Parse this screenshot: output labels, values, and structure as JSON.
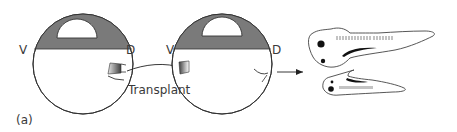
{
  "figure": {
    "panel_label": "(a)",
    "embryo_1": {
      "ventral_label": "V",
      "dorsal_label": "D"
    },
    "embryo_2": {
      "ventral_label": "V",
      "dorsal_label": "D"
    },
    "transplant_label": "Transplant",
    "colors": {
      "animal_cap": "#7a7a7a",
      "outline": "#333333",
      "graft_dark": "#4a4a4a",
      "graft_light": "#e0e0e0",
      "tadpole_fill": "#ffffff",
      "eye": "#111111"
    }
  }
}
